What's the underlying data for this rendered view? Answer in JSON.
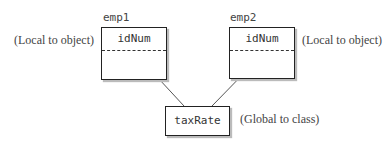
{
  "objects": [
    {
      "name": "emp1",
      "field": "idNum",
      "annotation": "(Local to object)"
    },
    {
      "name": "emp2",
      "field": "idNum",
      "annotation": "(Local to object)"
    }
  ],
  "shared": {
    "field": "taxRate",
    "annotation": "(Global to class)"
  },
  "colors": {
    "line": "#222222",
    "text": "#444444",
    "shadow": "#bbbbbb"
  }
}
